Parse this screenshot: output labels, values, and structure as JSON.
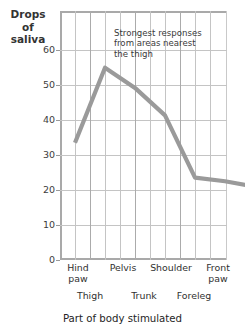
{
  "chart_data": {
    "type": "line",
    "title": "",
    "ylabel": "Drops of saliva",
    "ylabel_lines": [
      "Drops",
      "of",
      "saliva"
    ],
    "xlabel": "Part of body stimulated",
    "categories": [
      "Hind paw",
      "Thigh",
      "Pelvis",
      "Trunk",
      "Shoulder",
      "Foreleg",
      "Front paw"
    ],
    "values": [
      32,
      52.5,
      47,
      39.5,
      22.5,
      21.5,
      20
    ],
    "ylim": [
      0,
      68
    ],
    "yticks": [
      0,
      10,
      20,
      30,
      40,
      50,
      60
    ],
    "ytick_labels": [
      "0",
      "10",
      "20",
      "30",
      "40",
      "50",
      "60"
    ],
    "grid": true,
    "legend": "none",
    "line_color": "#9a9a9a",
    "grid_color": "#c4c4c4",
    "axis_color": "#a9a9a9",
    "annotations": [
      {
        "text": "Strongest responses from areas nearest the thigh",
        "lines": [
          "Strongest responses",
          "from areas nearest",
          "the thigh"
        ]
      }
    ]
  },
  "axes": {
    "y_title_line1": "Drops",
    "y_title_line2": "of",
    "y_title_line3": "saliva",
    "x_title": "Part of body stimulated"
  },
  "yticks": {
    "t0": "0",
    "t1": "10",
    "t2": "20",
    "t3": "30",
    "t4": "40",
    "t5": "50",
    "t6": "60"
  },
  "xticks": {
    "row1": [
      {
        "l1": "Hind",
        "l2": "paw"
      },
      {
        "l1": "Pelvis",
        "l2": ""
      },
      {
        "l1": "Shoulder",
        "l2": ""
      },
      {
        "l1": "Front",
        "l2": "paw"
      }
    ],
    "row2": [
      {
        "l1": "Thigh"
      },
      {
        "l1": "Trunk"
      },
      {
        "l1": "Foreleg"
      }
    ]
  },
  "annotation": {
    "line1": "Strongest responses",
    "line2": "from areas nearest",
    "line3": "the thigh"
  }
}
